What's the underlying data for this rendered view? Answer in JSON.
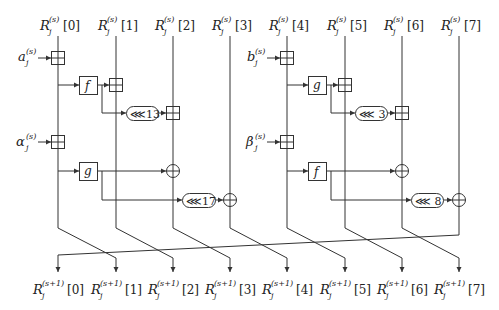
{
  "diagram": {
    "title": "",
    "columns": [
      {
        "index": 0,
        "x": 58,
        "top": "R_j^{(s)}[0]",
        "bottom": "R_j^{(s+1)}[0]"
      },
      {
        "index": 1,
        "x": 116,
        "top": "R_j^{(s)}[1]",
        "bottom": "R_j^{(s+1)}[1]"
      },
      {
        "index": 2,
        "x": 173,
        "top": "R_j^{(s)}[2]",
        "bottom": "R_j^{(s+1)}[2]"
      },
      {
        "index": 3,
        "x": 230,
        "top": "R_j^{(s)}[3]",
        "bottom": "R_j^{(s+1)}[3]"
      },
      {
        "index": 4,
        "x": 287,
        "top": "R_j^{(s)}[4]",
        "bottom": "R_j^{(s+1)}[4]"
      },
      {
        "index": 5,
        "x": 345,
        "top": "R_j^{(s)}[5]",
        "bottom": "R_j^{(s+1)}[5]"
      },
      {
        "index": 6,
        "x": 402,
        "top": "R_j^{(s)}[6]",
        "bottom": "R_j^{(s+1)}[6]"
      },
      {
        "index": 7,
        "x": 459,
        "top": "R_j^{(s)}[7]",
        "bottom": "R_j^{(s+1)}[7]"
      }
    ],
    "top_labels": {
      "base": "R",
      "sub": "j",
      "sup": "(s)",
      "idx": [
        "[0]",
        "[1]",
        "[2]",
        "[3]",
        "[4]",
        "[5]",
        "[6]",
        "[7]"
      ]
    },
    "bottom_labels": {
      "base": "R",
      "sub": "j",
      "sup": "(s+1)",
      "idx": [
        "[0]",
        "[1]",
        "[2]",
        "[3]",
        "[4]",
        "[5]",
        "[6]",
        "[7]"
      ]
    },
    "inputs": [
      {
        "name": "a",
        "sub": "j",
        "sup": "(s)",
        "target_column": 0
      },
      {
        "name": "α",
        "sub": "j",
        "sup": "(s)",
        "target_column": 0
      },
      {
        "name": "b",
        "sub": "j",
        "sup": "(s)",
        "target_column": 4
      },
      {
        "name": "β",
        "sub": "j",
        "sup": "(s)",
        "target_column": 4
      }
    ],
    "functions": {
      "left_upper": "f",
      "left_lower": "g",
      "right_upper": "g",
      "right_lower": "f"
    },
    "rotations": {
      "left_upper": "⋘13",
      "left_lower": "⋘17",
      "right_upper": "⋘ 3",
      "right_lower": "⋘ 8"
    },
    "operators": {
      "modular_add": "⊞",
      "xor": "⊕"
    },
    "permutation": "columns shift right by one; column 7 wraps to column 0"
  }
}
